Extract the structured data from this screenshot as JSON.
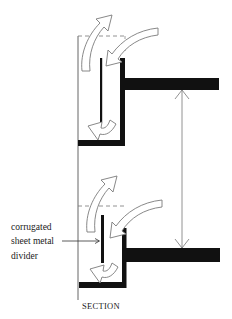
{
  "diagram": {
    "type": "architectural-section",
    "title": "SECTION",
    "annotation": {
      "lines": [
        "corrugated",
        "sheet metal",
        "divider"
      ]
    },
    "colors": {
      "ink": "#111111",
      "thin_line": "#555555",
      "arrow_fill": "#ffffff",
      "arrow_stroke": "#777777",
      "background": "#ffffff"
    },
    "elements": [
      "upper planter/gutter section with airflow arrows",
      "lower planter/gutter section with airflow arrows",
      "floor slabs",
      "floor-to-floor dimension line",
      "vertical corrugated sheet metal divider"
    ]
  }
}
